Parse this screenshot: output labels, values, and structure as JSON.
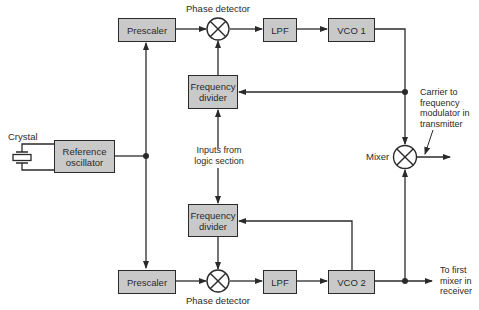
{
  "colors": {
    "box_fill": "#c9c9c9",
    "line": "#2a2a2a",
    "background": "#ffffff"
  },
  "blocks": {
    "prescaler_top": "Prescaler",
    "phase_detector_top": "Phase detector",
    "lpf_top": "LPF",
    "vco1": "VCO 1",
    "freq_divider_top": "Frequency\ndivider",
    "crystal": "Crystal",
    "reference_oscillator": "Reference\noscillator",
    "logic_inputs": "Inputs from\nlogic section",
    "freq_divider_bottom": "Frequency\ndivider",
    "prescaler_bottom": "Prescaler",
    "phase_detector_bottom": "Phase detector",
    "lpf_bottom": "LPF",
    "vco2": "VCO 2",
    "mixer": "Mixer",
    "carrier_output": "Carrier to\nfrequency\nmodulator in\ntransmitter",
    "receiver_output": "To first\nmixer in\nreceiver"
  }
}
